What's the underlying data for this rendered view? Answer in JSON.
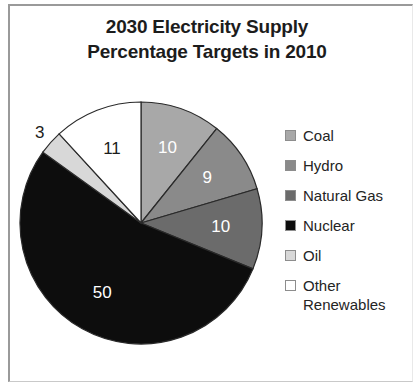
{
  "chart_data": {
    "type": "pie",
    "title": "2030 Electricity Supply Percentage Targets in 2010",
    "title_line1": "2030 Electricity Supply",
    "title_line2": "Percentage Targets in 2010",
    "xlabel": "",
    "ylabel": "",
    "legend_position": "right",
    "grid": false,
    "start_angle_deg": 0,
    "direction": "clockwise",
    "total": 93,
    "categories": [
      "Coal",
      "Hydro",
      "Natural Gas",
      "Nuclear",
      "Oil",
      "Other Renewables"
    ],
    "values": [
      10,
      9,
      10,
      50,
      3,
      11
    ],
    "labels": [
      "10",
      "9",
      "10",
      "50",
      "3",
      "11"
    ],
    "colors": [
      "#a8a8a8",
      "#8a8a8a",
      "#6b6b6b",
      "#0d0d0d",
      "#d8d8d8",
      "#ffffff"
    ],
    "slices": [
      {
        "name": "Coal",
        "value": 10,
        "label": "10",
        "color": "#a8a8a8",
        "label_color": "#ffffff",
        "label_inside": true
      },
      {
        "name": "Hydro",
        "value": 9,
        "label": "9",
        "color": "#8a8a8a",
        "label_color": "#ffffff",
        "label_inside": true
      },
      {
        "name": "Natural Gas",
        "value": 10,
        "label": "10",
        "color": "#6b6b6b",
        "label_color": "#ffffff",
        "label_inside": true
      },
      {
        "name": "Nuclear",
        "value": 50,
        "label": "50",
        "color": "#0d0d0d",
        "label_color": "#ffffff",
        "label_inside": true
      },
      {
        "name": "Oil",
        "value": 3,
        "label": "3",
        "color": "#d8d8d8",
        "label_color": "#1c1c1c",
        "label_inside": false
      },
      {
        "name": "Other Renewables",
        "value": 11,
        "label": "11",
        "color": "#ffffff",
        "label_color": "#1c1c1c",
        "label_inside": true
      }
    ]
  },
  "legend": {
    "items": [
      {
        "label": "Coal",
        "color": "#a8a8a8"
      },
      {
        "label": "Hydro",
        "color": "#8a8a8a"
      },
      {
        "label": "Natural Gas",
        "color": "#6b6b6b"
      },
      {
        "label": "Nuclear",
        "color": "#0d0d0d"
      },
      {
        "label": "Oil",
        "color": "#d8d8d8"
      },
      {
        "label": "Other\nRenewables",
        "color": "#ffffff"
      }
    ]
  }
}
